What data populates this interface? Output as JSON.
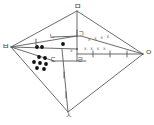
{
  "figure": {
    "width": 154,
    "height": 125,
    "background_color": "#ffffff",
    "stroke_color": "#5a5a5a",
    "dot_color": "#111111",
    "vertices": [
      {
        "id": "m",
        "label": "ㅁ",
        "x": 77,
        "y": 11,
        "label_x": 74,
        "label_y": 3
      },
      {
        "id": "b",
        "label": "ㅂ",
        "x": 11,
        "y": 47,
        "label_x": 2,
        "label_y": 43
      },
      {
        "id": "o",
        "label": "ㅇ",
        "x": 143,
        "y": 54,
        "label_x": 145,
        "label_y": 49
      },
      {
        "id": "s",
        "label": "ㅅ",
        "x": 68,
        "y": 112,
        "label_x": 65,
        "label_y": 112
      },
      {
        "id": "n",
        "label": "ㄴ",
        "x": 52,
        "y": 37,
        "label_x": 49,
        "label_y": 33
      },
      {
        "id": "g",
        "label": "ㄱ",
        "x": 81,
        "y": 36,
        "label_x": 78,
        "label_y": 31
      },
      {
        "id": "d",
        "label": "ㄷ",
        "x": 54,
        "y": 61,
        "label_x": 50,
        "label_y": 57
      },
      {
        "id": "r",
        "label": "ㄹ",
        "x": 80,
        "y": 61,
        "label_x": 77,
        "label_y": 57
      }
    ],
    "center_point": {
      "x": 77,
      "y": 49,
      "label": "x",
      "label_x": 70,
      "label_y": 49
    },
    "hatch_marks_upper": {
      "text": "x x x x",
      "x": 88,
      "y": 38
    },
    "hatch_marks_lower": {
      "text": "x x x x",
      "x": 84,
      "y": 47
    },
    "dot_groups": [
      {
        "name": "upper-dot-cluster",
        "count": 3,
        "dots": [
          {
            "x": 37,
            "y": 47
          },
          {
            "x": 42,
            "y": 47
          },
          {
            "x": 63,
            "y": 44
          }
        ]
      },
      {
        "name": "lower-dot-cluster",
        "count": 7,
        "dots": [
          {
            "x": 39,
            "y": 57
          },
          {
            "x": 45,
            "y": 58
          },
          {
            "x": 34,
            "y": 62
          },
          {
            "x": 40,
            "y": 63
          },
          {
            "x": 46,
            "y": 64
          },
          {
            "x": 37,
            "y": 68
          },
          {
            "x": 44,
            "y": 69
          }
        ]
      }
    ],
    "segments": [
      {
        "name": "m-to-b",
        "x1": 77,
        "y1": 11,
        "x2": 11,
        "y2": 47
      },
      {
        "name": "m-to-o",
        "x1": 77,
        "y1": 11,
        "x2": 143,
        "y2": 54
      },
      {
        "name": "m-to-center",
        "x1": 77,
        "y1": 11,
        "x2": 77,
        "y2": 61
      },
      {
        "name": "b-to-s",
        "x1": 11,
        "y1": 47,
        "x2": 68,
        "y2": 112
      },
      {
        "name": "b-to-n",
        "x1": 11,
        "y1": 47,
        "x2": 77,
        "y2": 36
      },
      {
        "name": "b-to-d",
        "x1": 11,
        "y1": 47,
        "x2": 54,
        "y2": 61
      },
      {
        "name": "b-to-center",
        "x1": 11,
        "y1": 47,
        "x2": 77,
        "y2": 49
      },
      {
        "name": "g-to-o",
        "x1": 81,
        "y1": 36,
        "x2": 143,
        "y2": 54
      },
      {
        "name": "center-to-o",
        "x1": 77,
        "y1": 54,
        "x2": 143,
        "y2": 54
      },
      {
        "name": "s-to-o",
        "x1": 68,
        "y1": 112,
        "x2": 143,
        "y2": 54
      },
      {
        "name": "s-to-g",
        "x1": 68,
        "y1": 112,
        "x2": 62,
        "y2": 49
      },
      {
        "name": "d-to-r",
        "x1": 54,
        "y1": 61,
        "x2": 86,
        "y2": 61
      },
      {
        "name": "n-to-g",
        "x1": 52,
        "y1": 37,
        "x2": 81,
        "y2": 36
      }
    ],
    "tick_marks": [
      {
        "name": "tick-b-n",
        "x": 36,
        "y": 42
      },
      {
        "name": "tick-axis-1",
        "x": 93,
        "y": 54
      },
      {
        "name": "tick-axis-2",
        "x": 110,
        "y": 54
      },
      {
        "name": "tick-axis-3",
        "x": 127,
        "y": 54
      },
      {
        "name": "tick-m-center",
        "x": 77,
        "y": 33
      },
      {
        "name": "tick-s-upper",
        "x": 64,
        "y": 75
      },
      {
        "name": "tick-s-lower",
        "x": 66,
        "y": 95
      }
    ]
  }
}
